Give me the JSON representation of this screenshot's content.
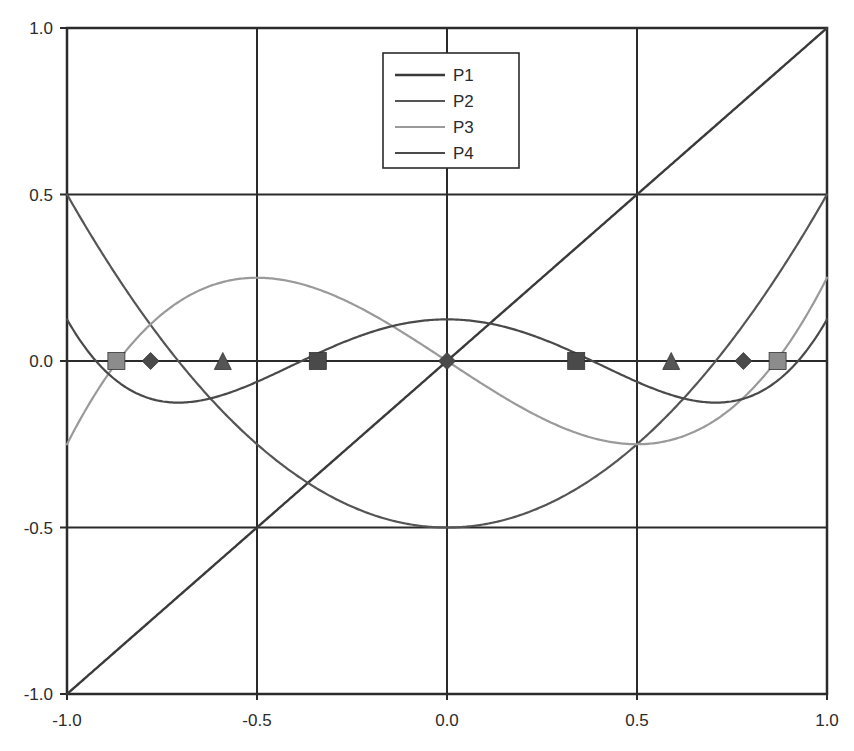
{
  "chart_data": {
    "type": "line",
    "title": "",
    "subtitle": "",
    "xlabel": "",
    "ylabel": "",
    "xlim": [
      -1.0,
      1.0
    ],
    "ylim": [
      -1.0,
      1.0
    ],
    "grid": true,
    "gridlines_x": [
      -1.0,
      -0.5,
      0.0,
      0.5,
      1.0
    ],
    "gridlines_y": [
      -1.0,
      -0.5,
      0.0,
      0.5,
      1.0
    ],
    "xticks": [
      -1.0,
      -0.5,
      0.0,
      0.5,
      1.0
    ],
    "xtick_labels": [
      "-1.0",
      "-0.5",
      "0.0",
      "0.5",
      "1.0"
    ],
    "yticks": [
      -1.0,
      -0.5,
      0.0,
      0.5,
      1.0
    ],
    "ytick_labels": [
      "-1.0",
      "-0.5",
      "0.0",
      "0.5",
      "1.0"
    ],
    "legend_position": "top-center",
    "legend_entries": [
      "P1",
      "P2",
      "P3",
      "P4"
    ],
    "series": [
      {
        "name": "P1",
        "color": "#3a3a3a",
        "width": 2.4,
        "formula": "x",
        "coeffs": [
          0,
          1
        ],
        "marker": "square",
        "marker_color": "#4a4a4a",
        "roots": [
          0.0
        ],
        "extrema": [],
        "endpoints": [
          {
            "x": -1.0,
            "y": -1.0
          },
          {
            "x": 1.0,
            "y": 1.0
          }
        ],
        "x": [
          -1.0,
          -0.9,
          -0.8,
          -0.7,
          -0.6,
          -0.5,
          -0.4,
          -0.3,
          -0.2,
          -0.1,
          0.0,
          0.1,
          0.2,
          0.3,
          0.4,
          0.5,
          0.6,
          0.7,
          0.8,
          0.9,
          1.0
        ],
        "values": [
          -1.0,
          -0.9,
          -0.8,
          -0.7,
          -0.6,
          -0.5,
          -0.4,
          -0.3,
          -0.2,
          -0.1,
          0.0,
          0.1,
          0.2,
          0.3,
          0.4,
          0.5,
          0.6,
          0.7,
          0.8,
          0.9,
          1.0
        ]
      },
      {
        "name": "P2",
        "color": "#555555",
        "width": 2.2,
        "formula": "x^2 - 0.5",
        "coeffs": [
          -0.5,
          0,
          1
        ],
        "marker": "triangle",
        "marker_color": "#555555",
        "roots": [
          -0.7071,
          0.7071
        ],
        "extrema": [
          {
            "x": 0.0,
            "y": -0.5
          }
        ],
        "endpoints": [
          {
            "x": -1.0,
            "y": 1.0
          },
          {
            "x": 1.0,
            "y": 1.0
          }
        ],
        "x": [
          -1.0,
          -0.9,
          -0.8,
          -0.7,
          -0.6,
          -0.5,
          -0.4,
          -0.3,
          -0.2,
          -0.1,
          0.0,
          0.1,
          0.2,
          0.3,
          0.4,
          0.5,
          0.6,
          0.7,
          0.8,
          0.9,
          1.0
        ],
        "values": [
          0.5,
          0.31,
          0.14,
          -0.01,
          -0.14,
          -0.25,
          -0.34,
          -0.41,
          -0.46,
          -0.49,
          -0.5,
          -0.49,
          -0.46,
          -0.41,
          -0.34,
          -0.25,
          -0.14,
          -0.01,
          0.14,
          0.31,
          0.5
        ]
      },
      {
        "name": "P3",
        "color": "#9a9a9a",
        "width": 2.2,
        "formula": "x^3 - 0.75x",
        "coeffs": [
          0,
          -0.75,
          0,
          1
        ],
        "marker": "diamond",
        "marker_color": "#8c8c8c",
        "roots": [
          -0.866,
          0.0,
          0.866
        ],
        "extrema": [
          {
            "x": -0.5,
            "y": 0.25
          },
          {
            "x": 0.5,
            "y": -0.25
          }
        ],
        "endpoints": [
          {
            "x": -1.0,
            "y": -0.25
          },
          {
            "x": 1.0,
            "y": 0.25
          }
        ],
        "x": [
          -1.0,
          -0.9,
          -0.8,
          -0.7,
          -0.6,
          -0.5,
          -0.4,
          -0.3,
          -0.2,
          -0.1,
          0.0,
          0.1,
          0.2,
          0.3,
          0.4,
          0.5,
          0.6,
          0.7,
          0.8,
          0.9,
          1.0
        ],
        "values": [
          -0.25,
          0.0,
          0.088,
          0.182,
          0.234,
          0.25,
          0.236,
          0.198,
          0.142,
          0.074,
          0.0,
          -0.074,
          -0.142,
          -0.198,
          -0.236,
          -0.25,
          -0.234,
          -0.182,
          -0.088,
          0.0,
          0.25
        ]
      },
      {
        "name": "P4",
        "color": "#4a4a4a",
        "width": 2.2,
        "formula": "x^4 - x^2 + 0.125",
        "coeffs": [
          0.125,
          0,
          -1,
          0,
          1
        ],
        "marker": "square",
        "marker_color": "#4a4a4a",
        "roots": [
          -0.9239,
          -0.3827,
          0.3827,
          0.9239
        ],
        "extrema": [
          {
            "x": -0.7071,
            "y": -0.125
          },
          {
            "x": 0.0,
            "y": 0.125
          },
          {
            "x": 0.7071,
            "y": -0.125
          }
        ],
        "endpoints": [
          {
            "x": -1.0,
            "y": 0.125
          },
          {
            "x": 1.0,
            "y": 0.125
          }
        ],
        "x": [
          -1.0,
          -0.9,
          -0.8,
          -0.7,
          -0.6,
          -0.5,
          -0.4,
          -0.3,
          -0.2,
          -0.1,
          0.0,
          0.1,
          0.2,
          0.3,
          0.4,
          0.5,
          0.6,
          0.7,
          0.8,
          0.9,
          1.0
        ],
        "values": [
          0.125,
          -0.029,
          -0.105,
          -0.129,
          -0.1286,
          -0.0625,
          0.0,
          0.0386,
          0.0866,
          0.1151,
          0.125,
          0.1151,
          0.0866,
          0.0386,
          0.0,
          -0.0625,
          -0.1286,
          -0.129,
          -0.105,
          -0.029,
          0.125
        ]
      }
    ],
    "root_markers": [
      {
        "x": -0.87,
        "y": 0.0,
        "shape": "square",
        "series": "P3"
      },
      {
        "x": -0.78,
        "y": 0.0,
        "shape": "diamond",
        "series": "P4"
      },
      {
        "x": -0.59,
        "y": 0.0,
        "shape": "triangle",
        "series": "P2"
      },
      {
        "x": -0.34,
        "y": 0.0,
        "shape": "square",
        "series": "P4"
      },
      {
        "x": 0.0,
        "y": 0.0,
        "shape": "diamond",
        "series": "P1"
      },
      {
        "x": 0.34,
        "y": 0.0,
        "shape": "square",
        "series": "P4"
      },
      {
        "x": 0.59,
        "y": 0.0,
        "shape": "triangle",
        "series": "P2"
      },
      {
        "x": 0.78,
        "y": 0.0,
        "shape": "diamond",
        "series": "P4"
      },
      {
        "x": 0.87,
        "y": 0.0,
        "shape": "square",
        "series": "P3"
      }
    ],
    "axis_color": "#2b2b2b",
    "background": "#ffffff"
  }
}
